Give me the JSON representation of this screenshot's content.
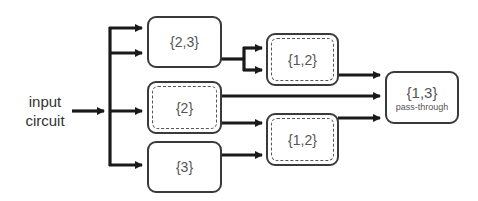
{
  "input": {
    "line1": "input",
    "line2": "circuit"
  },
  "nodes": {
    "n23": {
      "label": "{2,3}",
      "style": "solid"
    },
    "n2": {
      "label": "{2}",
      "style": "dashed"
    },
    "n3": {
      "label": "{3}",
      "style": "solid"
    },
    "n12_top": {
      "label": "{1,2}",
      "style": "dashed"
    },
    "n12_bottom": {
      "label": "{1,2}",
      "style": "dashed"
    },
    "n13": {
      "label": "{1,3}",
      "sublabel": "pass-through",
      "style": "solid"
    }
  },
  "colors": {
    "line": "#1a1a1a",
    "border": "#3a3a3a",
    "text": "#555555"
  }
}
